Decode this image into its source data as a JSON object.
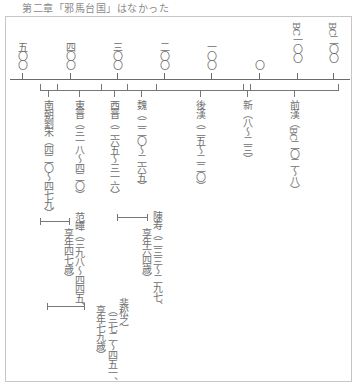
{
  "header": {
    "title": "第二章「邪馬台国」はなかった"
  },
  "axis": {
    "ticks": [
      {
        "label": "五〇〇",
        "x": 22
      },
      {
        "label": "四〇〇",
        "x": 70
      },
      {
        "label": "三〇〇",
        "x": 117
      },
      {
        "label": "二〇〇",
        "x": 164
      },
      {
        "label": "一〇〇",
        "x": 211
      },
      {
        "label": "〇",
        "x": 259
      },
      {
        "label": "BC一〇〇",
        "x": 297
      },
      {
        "label": "BC二〇〇",
        "x": 333
      }
    ]
  },
  "dynasties": [
    {
      "name": "南朝劉宋",
      "label": "南朝劉宋（四二〇〜四七九）"
    },
    {
      "name": "東晋",
      "label": "東晋（三一八〜四二〇）"
    },
    {
      "name": "西晋",
      "label": "西晋（二六五〜三一六）"
    },
    {
      "name": "魏",
      "label": "魏（二二〇〜二六五）"
    },
    {
      "name": "後漢",
      "label": "後漢（二五〜二二〇）"
    },
    {
      "name": "新",
      "label": "新（八〜二三）"
    },
    {
      "name": "前漢",
      "label": "前漢（BC二〇二〜八）"
    }
  ],
  "people": [
    {
      "name": "范曄",
      "line1": "范曄（三九八〜四四五、",
      "line2": "享年四七歳）"
    },
    {
      "name": "陳寿",
      "line1": "陳寿（二三三〜二九七、",
      "line2": "享年六四歳）"
    },
    {
      "name": "裴松之",
      "line1": "裴松之",
      "line2": "（三七二〜四五一、",
      "line3": "享年七九歳）"
    }
  ]
}
